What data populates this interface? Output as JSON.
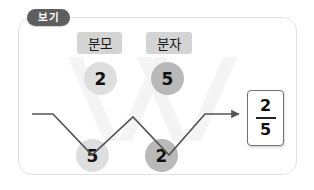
{
  "panel": {
    "tag_label": "보기",
    "border_color": "#e3e3e3",
    "tag_bg_color": "#5e5e5e"
  },
  "labels": {
    "denominator_chip": "분모",
    "numerator_chip": "분자",
    "chip_bg_color": "#d4d4d4"
  },
  "circles": {
    "top_left": "2",
    "top_right": "5",
    "bottom_left": "5",
    "bottom_right": "2",
    "light_color": "#dedede",
    "dark_color": "#b9b9b9"
  },
  "result": {
    "numerator": "2",
    "denominator": "5",
    "box_border_color": "#6f6f6f"
  },
  "diagram": {
    "line_color": "#555555",
    "ribbon_color": "#f2f2f2",
    "arrow_name": "arrow-to-result"
  }
}
